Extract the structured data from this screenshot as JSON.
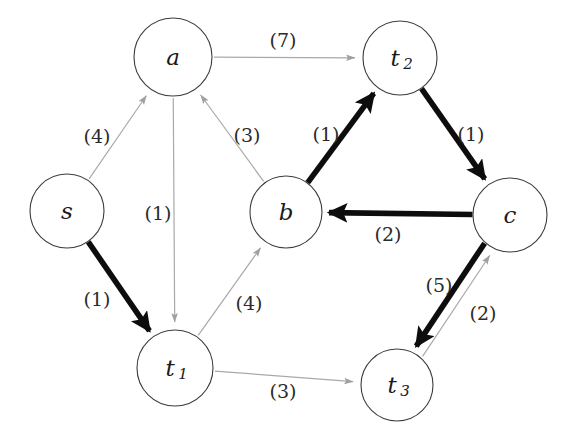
{
  "diagram": {
    "colors": {
      "background": "#ffffff",
      "node_stroke": "#3c3c3c",
      "node_fill": "#ffffff",
      "thin_edge": "#a9a9a9",
      "thick_edge": "#0d0d0d",
      "label_text": "#2b2b2b"
    },
    "nodes": [
      {
        "id": "s",
        "label": "s",
        "sub": "",
        "cx": 67,
        "cy": 211,
        "r": 37
      },
      {
        "id": "a",
        "label": "a",
        "sub": "",
        "cx": 173,
        "cy": 57,
        "r": 39
      },
      {
        "id": "t2",
        "label": "t",
        "sub": "2",
        "cx": 400,
        "cy": 58,
        "r": 37
      },
      {
        "id": "b",
        "label": "b",
        "sub": "",
        "cx": 286,
        "cy": 212,
        "r": 36
      },
      {
        "id": "c",
        "label": "c",
        "sub": "",
        "cx": 510,
        "cy": 215,
        "r": 37
      },
      {
        "id": "t1",
        "label": "t",
        "sub": "1",
        "cx": 175,
        "cy": 368,
        "r": 38
      },
      {
        "id": "t3",
        "label": "t",
        "sub": "3",
        "cx": 397,
        "cy": 385,
        "r": 36
      }
    ],
    "edges": [
      {
        "id": "s-a",
        "from": "s",
        "to": "a",
        "weight": "(4)",
        "style": "thin",
        "label_x": 97,
        "label_y": 136
      },
      {
        "id": "s-t1",
        "from": "s",
        "to": "t1",
        "weight": "(1)",
        "style": "thick",
        "label_x": 97,
        "label_y": 299
      },
      {
        "id": "a-t2",
        "from": "a",
        "to": "t2",
        "weight": "(7)",
        "style": "thin",
        "label_x": 283,
        "label_y": 40
      },
      {
        "id": "a-t1",
        "from": "a",
        "to": "t1",
        "weight": "(1)",
        "style": "thin",
        "label_x": 158,
        "label_y": 213
      },
      {
        "id": "b-a",
        "from": "b",
        "to": "a",
        "weight": "(3)",
        "style": "thin",
        "label_x": 247,
        "label_y": 135
      },
      {
        "id": "t1-b",
        "from": "t1",
        "to": "b",
        "weight": "(4)",
        "style": "thin",
        "label_x": 249,
        "label_y": 303
      },
      {
        "id": "b-t2",
        "from": "b",
        "to": "t2",
        "weight": "(1)",
        "style": "thick",
        "label_x": 326,
        "label_y": 134
      },
      {
        "id": "t2-c",
        "from": "t2",
        "to": "c",
        "weight": "(1)",
        "style": "thick",
        "label_x": 471,
        "label_y": 134
      },
      {
        "id": "c-b",
        "from": "c",
        "to": "b",
        "weight": "(2)",
        "style": "thick",
        "label_x": 388,
        "label_y": 234
      },
      {
        "id": "t3-c",
        "from": "t3",
        "to": "c",
        "weight": "(5)",
        "style": "thin",
        "label_x": 439,
        "label_y": 285
      },
      {
        "id": "c-t3",
        "from": "c",
        "to": "t3",
        "weight": "(2)",
        "style": "thick",
        "label_x": 483,
        "label_y": 313
      },
      {
        "id": "t1-t3",
        "from": "t1",
        "to": "t3",
        "weight": "(3)",
        "style": "thin",
        "label_x": 283,
        "label_y": 391
      }
    ]
  }
}
